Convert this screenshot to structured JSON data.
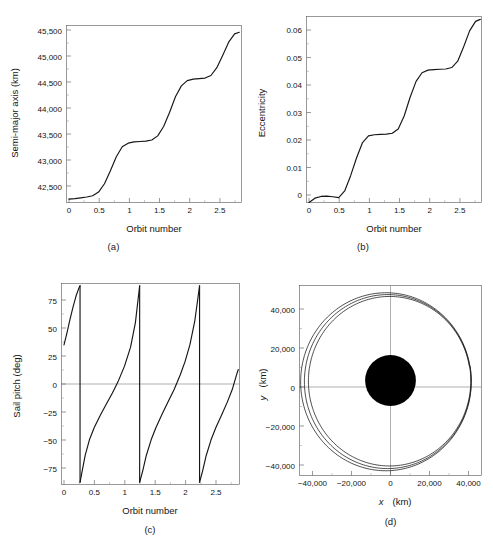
{
  "figure": {
    "panels": [
      {
        "id": "a",
        "caption": "(a)",
        "xlabel": "Orbit number",
        "ylabel": "Semi-major axis (km)",
        "xticks": [
          "0",
          "0.5",
          "1",
          "1.5",
          "2",
          "2.5"
        ],
        "yticks": [
          "42,500",
          "43,000",
          "43,500",
          "44,000",
          "44,500",
          "45,000",
          "45,500"
        ]
      },
      {
        "id": "b",
        "caption": "(b)",
        "xlabel": "Orbit number",
        "ylabel": "Eccentricity",
        "xticks": [
          "0",
          "0.5",
          "1",
          "1.5",
          "2",
          "2.5"
        ],
        "yticks": [
          "0",
          "0.01",
          "0.02",
          "0.03",
          "0.04",
          "0.05",
          "0.06"
        ]
      },
      {
        "id": "c",
        "caption": "(c)",
        "xlabel": "Orbit number",
        "ylabel": "Sail pitch (deg)",
        "xticks": [
          "0",
          "0.5",
          "1",
          "1.5",
          "2",
          "2.5"
        ],
        "yticks": [
          "75",
          "50",
          "25",
          "0",
          "−25",
          "−50",
          "−75"
        ]
      },
      {
        "id": "d",
        "caption": "(d)",
        "xlabel_italic": "x",
        "xlabel_unit": "(km)",
        "ylabel_italic": "y",
        "ylabel_unit": "(km)",
        "xticks": [
          "−40,000",
          "−20,000",
          "0",
          "20,000",
          "40,000"
        ],
        "yticks": [
          "40,000",
          "20,000",
          "0",
          "−20,000",
          "−40,000"
        ]
      }
    ]
  },
  "chart_data": [
    {
      "type": "line",
      "panel": "a",
      "title": "",
      "xlabel": "Orbit number",
      "ylabel": "Semi-major axis (km)",
      "xlim": [
        0,
        2.9
      ],
      "ylim": [
        42200,
        45600
      ],
      "xticks": [
        0,
        0.5,
        1,
        1.5,
        2,
        2.5
      ],
      "yticks": [
        42500,
        43000,
        43500,
        44000,
        44500,
        45000,
        45500
      ],
      "grid": false,
      "legend": null,
      "x": [
        0.0,
        0.1,
        0.2,
        0.3,
        0.4,
        0.5,
        0.6,
        0.7,
        0.8,
        0.9,
        1.0,
        1.1,
        1.2,
        1.3,
        1.4,
        1.5,
        1.6,
        1.7,
        1.8,
        1.9,
        2.0,
        2.1,
        2.2,
        2.3,
        2.4,
        2.5,
        2.6,
        2.7,
        2.8,
        2.88
      ],
      "y": [
        42265,
        42275,
        42290,
        42305,
        42330,
        42400,
        42560,
        42810,
        43080,
        43270,
        43340,
        43365,
        43372,
        43378,
        43400,
        43480,
        43660,
        43930,
        44230,
        44440,
        44540,
        44570,
        44580,
        44590,
        44640,
        44790,
        45030,
        45280,
        45440,
        45470
      ]
    },
    {
      "type": "line",
      "panel": "b",
      "title": "",
      "xlabel": "Orbit number",
      "ylabel": "Eccentricity",
      "xlim": [
        0,
        2.9
      ],
      "ylim": [
        0,
        0.0645
      ],
      "xticks": [
        0,
        0.5,
        1,
        1.5,
        2,
        2.5
      ],
      "yticks": [
        0,
        0.01,
        0.02,
        0.03,
        0.04,
        0.05,
        0.06
      ],
      "grid": false,
      "legend": null,
      "x": [
        0.0,
        0.1,
        0.2,
        0.3,
        0.4,
        0.5,
        0.6,
        0.7,
        0.8,
        0.9,
        1.0,
        1.1,
        1.2,
        1.3,
        1.4,
        1.5,
        1.6,
        1.7,
        1.8,
        1.9,
        2.0,
        2.1,
        2.2,
        2.3,
        2.4,
        2.5,
        2.6,
        2.7,
        2.8,
        2.88
      ],
      "y": [
        0.0,
        0.0015,
        0.0021,
        0.0022,
        0.002,
        0.0017,
        0.004,
        0.0093,
        0.0155,
        0.0208,
        0.0231,
        0.0235,
        0.0236,
        0.0237,
        0.024,
        0.0255,
        0.03,
        0.0365,
        0.042,
        0.045,
        0.0459,
        0.0461,
        0.0462,
        0.0463,
        0.0468,
        0.049,
        0.054,
        0.0595,
        0.0628,
        0.0635
      ]
    },
    {
      "type": "line",
      "panel": "c",
      "title": "",
      "xlabel": "Orbit number",
      "ylabel": "Sail pitch (deg)",
      "xlim": [
        0,
        2.9
      ],
      "ylim": [
        -90,
        90
      ],
      "xticks": [
        0,
        0.5,
        1,
        1.5,
        2,
        2.5
      ],
      "yticks": [
        75,
        50,
        25,
        0,
        -25,
        -50,
        -75
      ],
      "grid": false,
      "legend": null,
      "note": "sawtooth, discontinuities at orbit numbers 0.265, 1.25, 2.24",
      "segments": [
        {
          "x": [
            0.0,
            0.05,
            0.1,
            0.15,
            0.2,
            0.24,
            0.265
          ],
          "y": [
            35,
            46,
            58,
            69,
            79,
            85,
            88
          ]
        },
        {
          "x": [
            0.265,
            0.3,
            0.35,
            0.42,
            0.5,
            0.6,
            0.7,
            0.8,
            0.9,
            1.0,
            1.1,
            1.18,
            1.25
          ],
          "y": [
            -88,
            -78,
            -64,
            -50,
            -39,
            -28,
            -18,
            -8,
            3,
            16,
            33,
            55,
            88
          ]
        },
        {
          "x": [
            1.25,
            1.3,
            1.36,
            1.44,
            1.52,
            1.62,
            1.72,
            1.82,
            1.92,
            2.0,
            2.08,
            2.16,
            2.24
          ],
          "y": [
            -88,
            -78,
            -64,
            -50,
            -39,
            -27,
            -16,
            -5,
            8,
            20,
            35,
            56,
            88
          ]
        },
        {
          "x": [
            2.24,
            2.29,
            2.35,
            2.43,
            2.51,
            2.61,
            2.7,
            2.78,
            2.85,
            2.88
          ],
          "y": [
            -88,
            -78,
            -64,
            -50,
            -39,
            -27,
            -16,
            -5,
            8,
            13
          ]
        }
      ]
    },
    {
      "type": "line",
      "panel": "d",
      "title": "",
      "xlabel": "x (km)",
      "ylabel": "y (km)",
      "xlim": [
        -48000,
        48000
      ],
      "ylim": [
        -48000,
        48000
      ],
      "xticks": [
        -40000,
        -20000,
        0,
        20000,
        40000
      ],
      "yticks": [
        40000,
        20000,
        0,
        -20000,
        -40000
      ],
      "grid": false,
      "legend": null,
      "central_body": {
        "name": "Earth",
        "radius_km": 6378,
        "color": "#000000"
      },
      "note": "spiral trajectory, 3 revolutions, semi-major axis growing 42,270 -> 45,470 km, eccentricity 0 -> 0.064, apogee toward -x/+y side",
      "orbits": [
        {
          "a_km": 42270,
          "e": 0.002,
          "arg_perigee_deg": 10
        },
        {
          "a_km": 43370,
          "e": 0.0235,
          "arg_perigee_deg": 10
        },
        {
          "a_km": 44570,
          "e": 0.046,
          "arg_perigee_deg": 10
        },
        {
          "a_km": 45470,
          "e": 0.0635,
          "arg_perigee_deg": 10
        }
      ]
    }
  ]
}
